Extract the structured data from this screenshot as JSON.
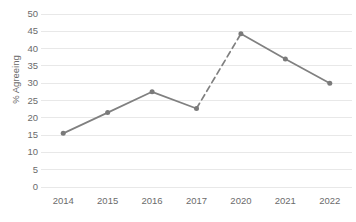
{
  "chart_data": {
    "type": "line",
    "title": "",
    "xlabel": "",
    "ylabel": "% Agreeing",
    "categories": [
      "2014",
      "2015",
      "2016",
      "2017",
      "2020",
      "2021",
      "2022"
    ],
    "values": [
      15.5,
      21.5,
      27.5,
      22.7,
      44.3,
      37.0,
      30.0
    ],
    "series": [
      {
        "name": "% Agreeing",
        "values": [
          15.5,
          21.5,
          27.5,
          22.7,
          44.3,
          37.0,
          30.0
        ]
      }
    ],
    "ylim": [
      0,
      50
    ],
    "ytick_step": 5,
    "ytick_labels": [
      "0",
      "5",
      "10",
      "15",
      "20",
      "25",
      "30",
      "35",
      "40",
      "45",
      "50"
    ],
    "grid": true,
    "grid_axis": "y",
    "legend": false,
    "legend_position": "none",
    "line_color": "#808080",
    "grid_color": "#e8e8e8",
    "marker": "circle",
    "marker_color": "#7a7a7a",
    "dashed_segments": [
      {
        "from_category": "2017",
        "to_category": "2020",
        "note": "dashed to indicate gap in data collection (no 2018 or 2019)"
      }
    ],
    "annotations": []
  },
  "axes": {
    "y_title": "% Agreeing"
  },
  "header": {
    "title": ""
  }
}
